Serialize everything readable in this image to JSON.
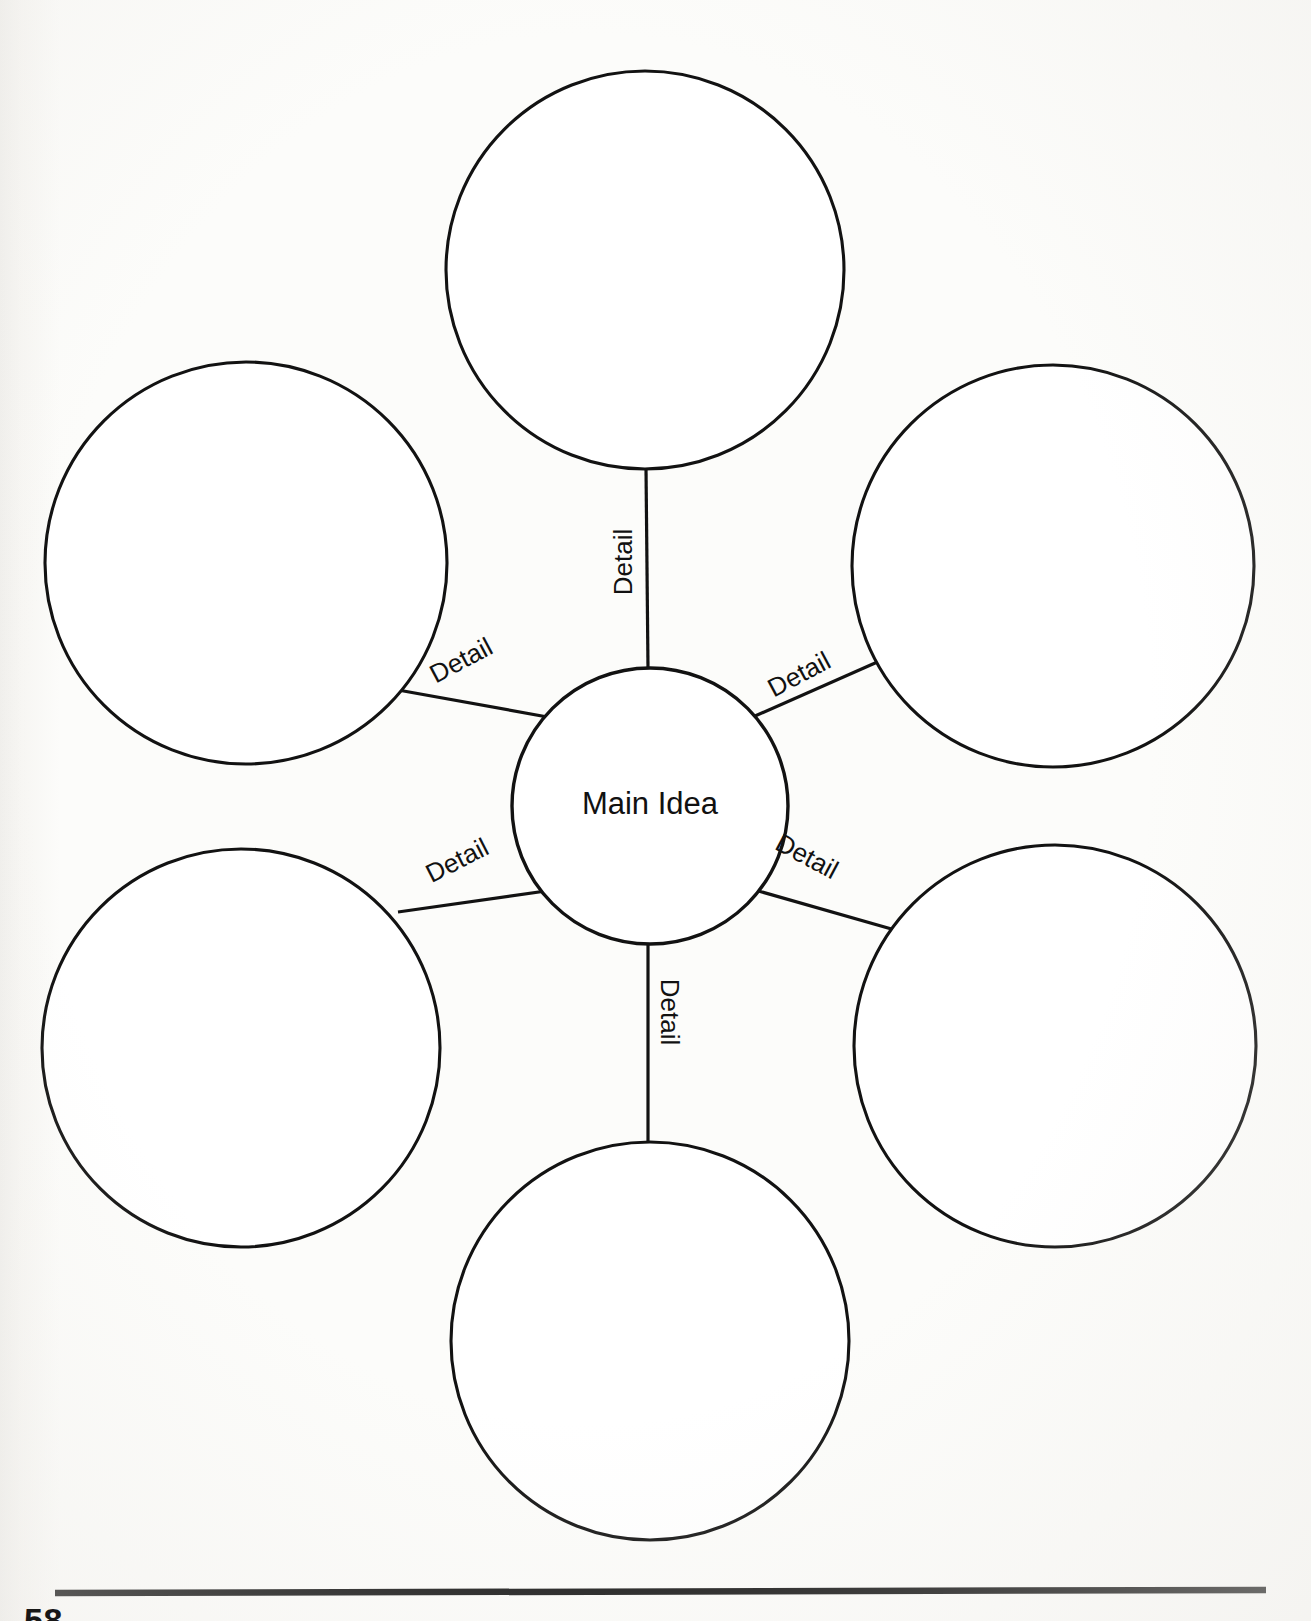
{
  "document": {
    "type": "graphic-organizer",
    "organizer_name": "web-diagram",
    "page_number": "58",
    "background_color": "#fbfbf9",
    "ink_color": "#121212"
  },
  "diagram": {
    "center": {
      "label": "Main Idea",
      "cx": 650,
      "cy": 806,
      "r": 138
    },
    "spokes": [
      {
        "id": "spoke-top",
        "label": "Detail",
        "rotation": -90,
        "label_x": 625,
        "label_y": 562,
        "line": {
          "x1": 646,
          "y1": 468,
          "x2": 648,
          "y2": 668
        }
      },
      {
        "id": "spoke-upper-left",
        "label": "Detail",
        "rotation": -28,
        "label_x": 462,
        "label_y": 662,
        "line": {
          "x1": 398,
          "y1": 690,
          "x2": 553,
          "y2": 718
        }
      },
      {
        "id": "spoke-upper-right",
        "label": "Detail",
        "rotation": -28,
        "label_x": 800,
        "label_y": 676,
        "line": {
          "x1": 746,
          "y1": 720,
          "x2": 900,
          "y2": 652
        }
      },
      {
        "id": "spoke-lower-left",
        "label": "Detail",
        "rotation": -27,
        "label_x": 458,
        "label_y": 862,
        "line": {
          "x1": 398,
          "y1": 912,
          "x2": 553,
          "y2": 890
        }
      },
      {
        "id": "spoke-lower-right",
        "label": "Detail",
        "rotation": 28,
        "label_x": 806,
        "label_y": 858,
        "line": {
          "x1": 748,
          "y1": 888,
          "x2": 902,
          "y2": 932
        }
      },
      {
        "id": "spoke-bottom",
        "label": "Detail",
        "rotation": 90,
        "label_x": 668,
        "label_y": 1012,
        "line": {
          "x1": 648,
          "y1": 942,
          "x2": 648,
          "y2": 1142
        }
      }
    ],
    "detail_circles": [
      {
        "id": "detail-circle-top",
        "cx": 645,
        "cy": 270,
        "r": 199
      },
      {
        "id": "detail-circle-upper-left",
        "cx": 246,
        "cy": 563,
        "r": 201
      },
      {
        "id": "detail-circle-upper-right",
        "cx": 1053,
        "cy": 566,
        "r": 201
      },
      {
        "id": "detail-circle-lower-left",
        "cx": 241,
        "cy": 1048,
        "r": 199
      },
      {
        "id": "detail-circle-lower-right",
        "cx": 1055,
        "cy": 1046,
        "r": 201
      },
      {
        "id": "detail-circle-bottom",
        "cx": 650,
        "cy": 1341,
        "r": 199
      }
    ]
  },
  "footer": {
    "rule": {
      "x1": 55,
      "y1": 1593,
      "x2": 1266,
      "y2": 1590
    }
  }
}
